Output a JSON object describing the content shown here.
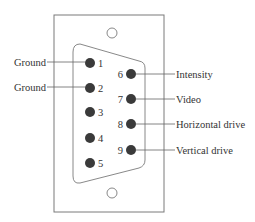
{
  "diagram": {
    "type": "connector-pinout",
    "connector": "DE-9 (9-pin D-sub)",
    "colors": {
      "line": "#7a7a7a",
      "pin": "#3a3a3a",
      "text": "#333333",
      "background": "#ffffff"
    },
    "pins": [
      {
        "number": "1",
        "label": "Ground",
        "side": "left"
      },
      {
        "number": "2",
        "label": "Ground",
        "side": "left"
      },
      {
        "number": "3",
        "label": "",
        "side": "left"
      },
      {
        "number": "4",
        "label": "",
        "side": "left"
      },
      {
        "number": "5",
        "label": "",
        "side": "left"
      },
      {
        "number": "6",
        "label": "Intensity",
        "side": "right"
      },
      {
        "number": "7",
        "label": "Video",
        "side": "right"
      },
      {
        "number": "8",
        "label": "Horizontal drive",
        "side": "right"
      },
      {
        "number": "9",
        "label": "Vertical drive",
        "side": "right"
      }
    ]
  }
}
